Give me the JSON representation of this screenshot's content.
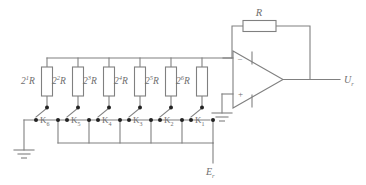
{
  "diagram": {
    "colors": {
      "line": "#808080",
      "text": "#6e6e6e",
      "fill": "#ffffff",
      "node": "#222222"
    },
    "feedback_resistor": {
      "label_base": "R",
      "label_exp": "",
      "label_sub": ""
    },
    "output_label": {
      "base": "U",
      "sub": "r"
    },
    "reference_label": {
      "base": "E",
      "sub": "r"
    },
    "opamp": {
      "minus": "–",
      "plus": "+"
    },
    "resistors": [
      {
        "id": "r1",
        "base": "2",
        "exp": "1",
        "tail": "R",
        "x": 47
      },
      {
        "id": "r2",
        "base": "2",
        "exp": "2",
        "tail": "R",
        "x": 78
      },
      {
        "id": "r3",
        "base": "2",
        "exp": "3",
        "tail": "R",
        "x": 109
      },
      {
        "id": "r4",
        "base": "2",
        "exp": "4",
        "tail": "R",
        "x": 140
      },
      {
        "id": "r5",
        "base": "2",
        "exp": "5",
        "tail": "R",
        "x": 171
      },
      {
        "id": "r6",
        "base": "2",
        "exp": "6",
        "tail": "R",
        "x": 202
      }
    ],
    "switches": [
      {
        "id": "k6",
        "base": "K",
        "sub": "6",
        "x": 47
      },
      {
        "id": "k5",
        "base": "K",
        "sub": "5",
        "x": 78
      },
      {
        "id": "k4",
        "base": "K",
        "sub": "4",
        "x": 109
      },
      {
        "id": "k3",
        "base": "K",
        "sub": "3",
        "x": 140
      },
      {
        "id": "k2",
        "base": "K",
        "sub": "2",
        "x": 171
      },
      {
        "id": "k1",
        "base": "K",
        "sub": "1",
        "x": 202
      }
    ]
  }
}
